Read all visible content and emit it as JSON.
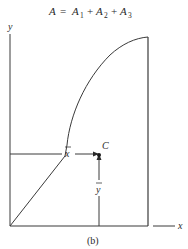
{
  "equation": {
    "lhs": "A",
    "eq": "=",
    "terms": [
      {
        "base": "A",
        "sub": "1"
      },
      {
        "base": "A",
        "sub": "2"
      },
      {
        "base": "A",
        "sub": "3"
      }
    ],
    "plus": "+"
  },
  "axes": {
    "x_label": "x",
    "y_label": "y"
  },
  "centroid": {
    "label": "C",
    "xbar_label": "x",
    "ybar_label": "y"
  },
  "caption": "(b)",
  "colors": {
    "stroke": "#3a3a3a",
    "text": "#2a2a2a"
  }
}
